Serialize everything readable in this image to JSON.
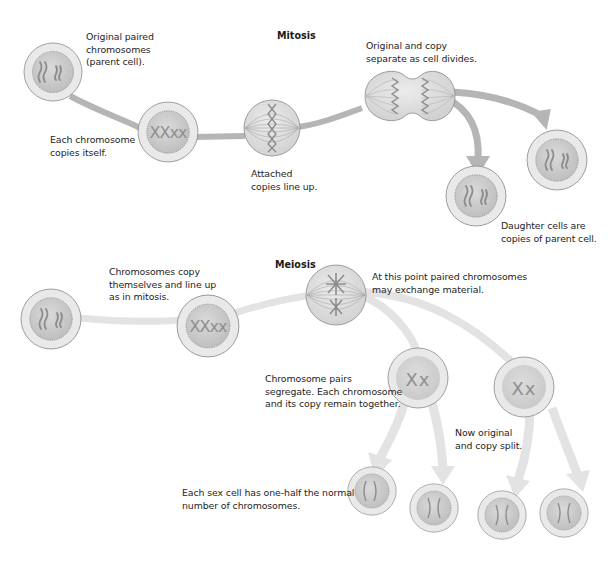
{
  "diagram": {
    "colors": {
      "background": "#ffffff",
      "mitosis_path": "#b3b3b3",
      "meiosis_path": "#e2e2e2",
      "cell_outer": "#e8e8e8",
      "cell_nucleus": "#cfcfcf",
      "chromosome": "#8c8c8c",
      "outline": "#8a8a8a",
      "text": "#1e1e1e"
    },
    "mitosis": {
      "title": "Mitosis",
      "labels": {
        "parent": "Original paired\nchromosomes\n(parent cell).",
        "copies": "Each chromosome\ncopies itself.",
        "line_up": "Attached\ncopies line up.",
        "separate": "Original and copy\nseparate as cell divides.",
        "daughters": "Daughter cells are\ncopies of parent cell."
      },
      "stages": [
        {
          "id": "parent-cell",
          "chromosomes": "paired"
        },
        {
          "id": "replicated-cell",
          "chromosomes": "XXxx"
        },
        {
          "id": "metaphase-cell",
          "chromosomes": "aligned on spindle"
        },
        {
          "id": "dividing-cell",
          "chromosomes": "separating"
        },
        {
          "id": "daughter-cell-1",
          "chromosomes": "paired"
        },
        {
          "id": "daughter-cell-2",
          "chromosomes": "paired"
        }
      ]
    },
    "meiosis": {
      "title": "Meiosis",
      "labels": {
        "copy_line_up": "Chromosomes copy\nthemselves and line up\nas in mitosis.",
        "exchange": "At this point paired chromosomes\nmay exchange material.",
        "segregate": "Chromosome pairs\nsegregate. Each chromosome\nand its copy remain together.",
        "split": "Now original\nand copy split.",
        "sex_cell": "Each sex cell has one-half the normal\nnumber of chromosomes."
      },
      "stages": [
        {
          "id": "parent-cell",
          "chromosomes": "paired"
        },
        {
          "id": "replicated-cell",
          "chromosomes": "XXxx"
        },
        {
          "id": "crossover-cell",
          "chromosomes": "exchanging"
        },
        {
          "id": "first-division-cell-1",
          "chromosomes": "Xx"
        },
        {
          "id": "first-division-cell-2",
          "chromosomes": "Xx"
        },
        {
          "id": "sex-cell-1",
          "chromosomes": "half"
        },
        {
          "id": "sex-cell-2",
          "chromosomes": "half"
        },
        {
          "id": "sex-cell-3",
          "chromosomes": "half"
        },
        {
          "id": "sex-cell-4",
          "chromosomes": "half"
        }
      ]
    }
  }
}
